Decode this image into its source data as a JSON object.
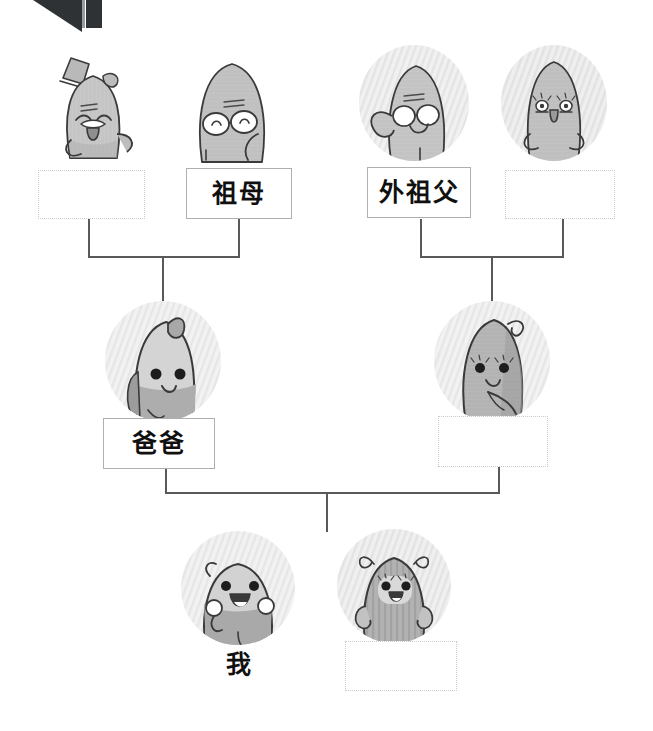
{
  "document": {
    "type": "family-tree-worksheet",
    "language": "zh",
    "title_text": "",
    "background_color": "#ffffff",
    "line_color": "#58595b",
    "filled_box_border_color": "#adb0b2",
    "blank_box_border_color": "#c9cccd",
    "text_color": "#101010"
  },
  "artifact": {
    "name": "page-corner-wedge",
    "color": "#2f3234"
  },
  "generations": [
    {
      "row": "grandparents",
      "people": [
        {
          "id": "paternal-grandfather",
          "label": "",
          "filled": false,
          "avatar": "grandfather-top-hat-mustache",
          "avatar_shape": "freeform"
        },
        {
          "id": "paternal-grandmother",
          "label": "祖母",
          "filled": true,
          "avatar": "grandmother-glasses",
          "avatar_shape": "freeform"
        },
        {
          "id": "maternal-grandfather",
          "label": "外祖父",
          "filled": true,
          "avatar": "maternal-grandfather-waving-glasses",
          "avatar_shape": "circle"
        },
        {
          "id": "maternal-grandmother",
          "label": "",
          "filled": false,
          "avatar": "maternal-grandmother-eyelashes",
          "avatar_shape": "circle"
        }
      ]
    },
    {
      "row": "parents",
      "people": [
        {
          "id": "father",
          "label": "爸爸",
          "filled": true,
          "avatar": "father-cowlick",
          "avatar_shape": "circle"
        },
        {
          "id": "mother",
          "label": "",
          "filled": false,
          "avatar": "mother-curl-hair",
          "avatar_shape": "circle"
        }
      ]
    },
    {
      "row": "children",
      "people": [
        {
          "id": "self",
          "label": "我",
          "filled": false,
          "boxed": false,
          "avatar": "child-boy-arms-up",
          "avatar_shape": "circle"
        },
        {
          "id": "sibling",
          "label": "",
          "filled": false,
          "boxed": true,
          "avatar": "child-girl-pigtails",
          "avatar_shape": "circle"
        }
      ]
    }
  ],
  "connectors": [
    {
      "id": "paternal-pair-to-father",
      "from": [
        "paternal-grandfather",
        "paternal-grandmother"
      ],
      "to": "father"
    },
    {
      "id": "maternal-pair-to-mother",
      "from": [
        "maternal-grandfather",
        "maternal-grandmother"
      ],
      "to": "mother"
    },
    {
      "id": "parents-to-children",
      "from": [
        "father",
        "mother"
      ],
      "to": [
        "self",
        "sibling"
      ]
    }
  ]
}
